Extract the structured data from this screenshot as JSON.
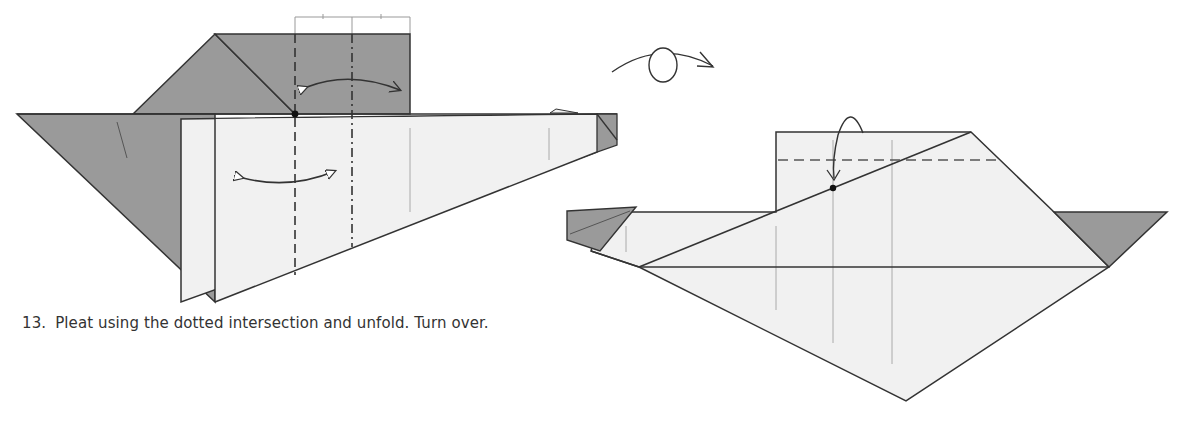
{
  "step": {
    "number": "13.",
    "instruction": "Pleat using the dotted intersection and unfold. Turn over."
  },
  "colors": {
    "paper_dark": "#9a9a9a",
    "paper_light": "#f1f1f1",
    "line": "#333333",
    "crease": "#8a8a8a",
    "background": "#ffffff"
  },
  "symbols": {
    "left_figure": [
      "valley-fold-line",
      "mountain-fold-line",
      "reference-point",
      "fold-unfold-arrow-top",
      "fold-unfold-arrow-bottom"
    ],
    "turn_over": "turn-over-icon",
    "right_figure": [
      "valley-fold-line",
      "reference-point",
      "fold-arrow"
    ]
  }
}
